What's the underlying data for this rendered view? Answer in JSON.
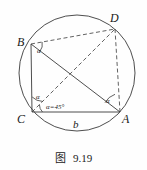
{
  "figure": {
    "caption_label": "图",
    "caption_number": "9.19",
    "stroke_color": "#3a3a3a",
    "text_color": "#1a1a1a",
    "background_color": "#fefefe"
  },
  "vertices": [
    {
      "name": "B",
      "label": "B",
      "x": 31,
      "y": 44,
      "label_x": 17,
      "label_y": 36
    },
    {
      "name": "C",
      "label": "C",
      "x": 32,
      "y": 112,
      "label_x": 17,
      "label_y": 113
    },
    {
      "name": "A",
      "label": "A",
      "x": 120,
      "y": 112,
      "label_x": 122,
      "label_y": 113
    },
    {
      "name": "D",
      "label": "D",
      "x": 115,
      "y": 29,
      "label_x": 110,
      "label_y": 12
    }
  ],
  "circle": {
    "center_x": 77,
    "center_y": 73,
    "radius": 58
  },
  "solid_segments": [
    {
      "from": "B",
      "to": "C"
    },
    {
      "from": "C",
      "to": "A"
    },
    {
      "from": "B",
      "to": "A"
    }
  ],
  "dashed_segments": [
    {
      "from": "B",
      "to": "D"
    },
    {
      "from": "C",
      "to": "D"
    },
    {
      "from": "D",
      "to": "A"
    }
  ],
  "angle_marks": [
    {
      "at": "B",
      "label": "α",
      "label_x": 37,
      "label_y": 48
    },
    {
      "at": "C",
      "label": "α",
      "label_x": 36,
      "label_y": 94
    },
    {
      "at": "C",
      "label": "α=45°",
      "label_x": 46,
      "label_y": 104
    },
    {
      "at": "A",
      "label": "α",
      "label_x": 106,
      "label_y": 98
    }
  ],
  "side_labels": [
    {
      "name": "side-b",
      "label": "b",
      "label_x": 73,
      "label_y": 119
    }
  ]
}
